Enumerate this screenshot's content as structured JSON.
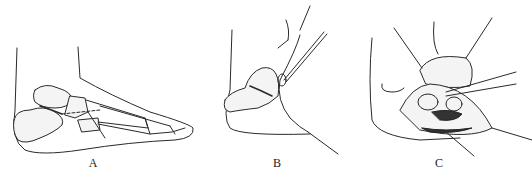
{
  "figure": {
    "panels": [
      {
        "id": "A",
        "label": "A",
        "description": "Lateral view of foot skeleton outline with tarsal and metatarsal bones; dashed incision line"
      },
      {
        "id": "B",
        "label": "B",
        "description": "Heel region with calcaneus; sural nerve and tendon retracted by hooks"
      },
      {
        "id": "C",
        "label": "C",
        "description": "Open wound with four retractors exposing subtalar joint structures"
      }
    ]
  }
}
